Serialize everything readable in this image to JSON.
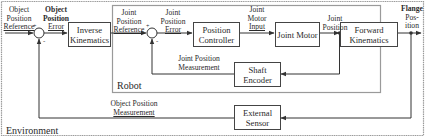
{
  "diagram": {
    "regions": {
      "environment": "Environment",
      "robot": "Robot"
    },
    "blocks": {
      "inverse_kinematics": "Inverse Kinematics",
      "position_controller": "Position Controller",
      "joint_motor": "Joint Motor",
      "forward_kinematics": "Forward Kinematics",
      "shaft_encoder": "Shaft Encoder",
      "external_sensor": "External Sensor"
    },
    "signals": {
      "object_position_reference": [
        "Object",
        "Position",
        "Reference"
      ],
      "object_position_error": [
        "Object",
        "Position",
        "Error"
      ],
      "joint_position_reference": [
        "Joint",
        "Position",
        "Reference"
      ],
      "joint_position_error": [
        "Joint",
        "Position",
        "Error"
      ],
      "joint_motor_input": [
        "Joint",
        "Motor",
        "Input"
      ],
      "joint_position": [
        "Joint",
        "Position"
      ],
      "flange_position": [
        "Flange",
        "Pos-",
        "ition"
      ],
      "joint_position_measurement": [
        "Joint Position",
        "Measurement"
      ],
      "object_position_measurement": [
        "Object Position",
        "Measurement"
      ]
    },
    "summing_junctions": {
      "sum1": {
        "plus": "+",
        "minus": "-"
      },
      "sum2": {
        "plus": "+",
        "minus": "-"
      }
    },
    "colors": {
      "line": "#333333",
      "region_border": "#999999"
    }
  }
}
